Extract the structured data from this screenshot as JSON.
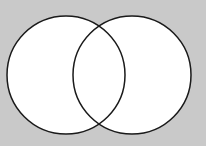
{
  "diagram": {
    "type": "venn",
    "background": "#c9c9c9",
    "stroke": "#1a1a1a",
    "fill": "#ffffff",
    "circles": [
      {
        "name": "left",
        "cx": 66,
        "cy": 75,
        "r": 59
      },
      {
        "name": "right",
        "cx": 132,
        "cy": 75,
        "r": 59
      }
    ],
    "labels": []
  }
}
